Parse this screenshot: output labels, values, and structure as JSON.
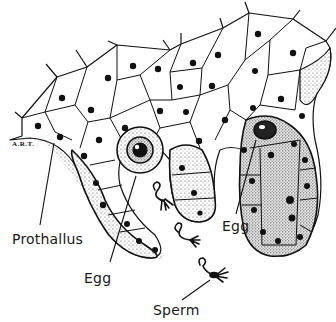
{
  "diagram": {
    "labels": {
      "prothallus": "Prothallus",
      "egg_left": "Egg",
      "egg_right": "Egg",
      "sperm": "Sperm"
    },
    "signature": "A.R.T.",
    "colors": {
      "ink": "#111111",
      "background": "#ffffff",
      "stipple": "#555555"
    }
  }
}
